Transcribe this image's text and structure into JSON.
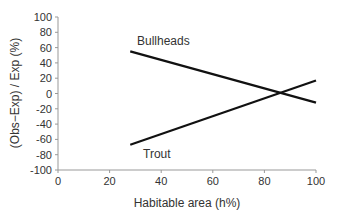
{
  "chart_data": {
    "type": "line",
    "title": "",
    "xlabel": "Habitable area (h%)",
    "ylabel": "(Obs−Exp) / Exp (%)",
    "xlim": [
      0,
      100
    ],
    "ylim": [
      -100,
      100
    ],
    "xticks": [
      "0",
      "20",
      "40",
      "60",
      "80",
      "100"
    ],
    "yticks": [
      "100",
      "80",
      "60",
      "40",
      "20",
      "0",
      "-20",
      "-40",
      "-60",
      "-80",
      "-100"
    ],
    "grid": false,
    "legend": "inline labels",
    "series": [
      {
        "name": "Bullheads",
        "x": [
          28,
          100
        ],
        "y": [
          55,
          -12
        ]
      },
      {
        "name": "Trout",
        "x": [
          28,
          100
        ],
        "y": [
          -67,
          17
        ]
      }
    ]
  }
}
